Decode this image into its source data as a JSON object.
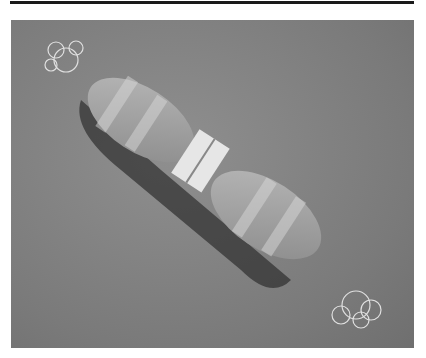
{
  "figure": {
    "background_color": "#7e7e7e",
    "rule_color": "#1a1a1a"
  }
}
